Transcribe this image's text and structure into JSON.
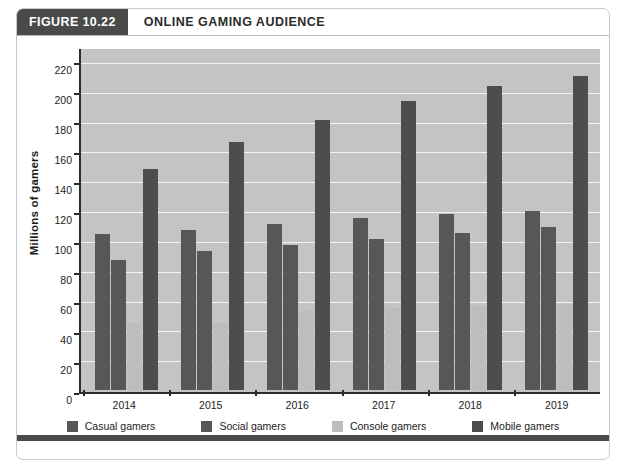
{
  "header": {
    "badge": "FIGURE 10.22",
    "title": "ONLINE GAMING AUDIENCE"
  },
  "chart_data": {
    "type": "bar",
    "title": "ONLINE GAMING AUDIENCE",
    "xlabel": "",
    "ylabel": "Millions of gamers",
    "categories": [
      "2014",
      "2015",
      "2016",
      "2017",
      "2018",
      "2019"
    ],
    "series": [
      {
        "name": "Casual gamers",
        "color": "#575757",
        "values": [
          105,
          108,
          112,
          116,
          119,
          121
        ]
      },
      {
        "name": "Social gamers",
        "color": "#575757",
        "values": [
          88,
          94,
          98,
          102,
          106,
          110
        ]
      },
      {
        "name": "Console gamers",
        "color": "#bdbdbd",
        "values": [
          45,
          45,
          53,
          55,
          57,
          58
        ]
      },
      {
        "name": "Mobile gamers",
        "color": "#4d4d4d",
        "values": [
          149,
          167,
          182,
          195,
          205,
          212
        ]
      }
    ],
    "ylim": [
      0,
      230
    ],
    "yticks": [
      0,
      20,
      40,
      60,
      80,
      100,
      120,
      140,
      160,
      180,
      200,
      220
    ],
    "grid": true,
    "legend_position": "bottom",
    "plot_background": "#c4c4c4",
    "gridline_color": "#f2f2f2"
  }
}
